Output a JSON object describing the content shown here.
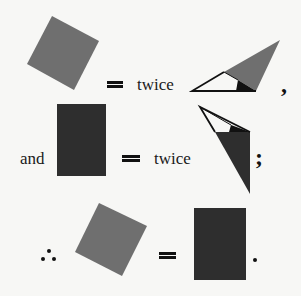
{
  "figure": {
    "title": "",
    "colors": {
      "background": "#f7f7f5",
      "grey_square": "#6f6f6f",
      "dark_rectangle": "#2e2e2e",
      "triangle_outline": "#111111",
      "angle_wedge": "#111111"
    },
    "row1": {
      "shape_left": "grey-tilted-square",
      "operator": "=",
      "word": "twice",
      "shape_right": "triangle-with-grey-region-and-black-angle",
      "punctuation": ","
    },
    "row2": {
      "prefix": "and",
      "shape_left": "dark-rectangle",
      "operator": "=",
      "word": "twice",
      "shape_right": "triangle-with-dark-region-and-black-angle",
      "punctuation": ";"
    },
    "row3": {
      "prefix_symbol": "therefore-symbol",
      "prefix": "∴",
      "shape_left": "grey-tilted-square",
      "operator": "=",
      "shape_right": "dark-rectangle",
      "punctuation": "."
    }
  }
}
